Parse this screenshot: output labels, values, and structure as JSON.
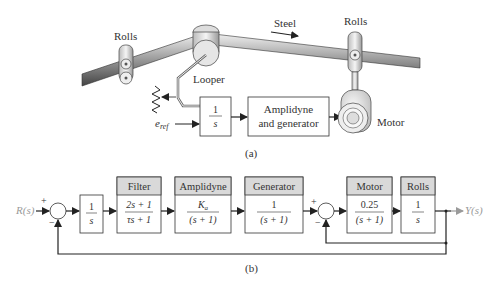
{
  "figure_a": {
    "caption": "(a)",
    "labels": {
      "rolls_left": "Rolls",
      "rolls_right": "Rolls",
      "steel": "Steel",
      "looper": "Looper",
      "motor": "Motor",
      "eref": "e",
      "eref_sub": "ref"
    },
    "blocks": [
      {
        "id": "integrator",
        "num": "1",
        "den": "s"
      },
      {
        "id": "amplidyne_generator",
        "line1": "Amplidyne",
        "line2": "and generator"
      }
    ]
  },
  "figure_b": {
    "caption": "(b)",
    "input_label": "R(s)",
    "output_label": "Y(s)",
    "sum1_signs": {
      "top": "+",
      "bottom": "−"
    },
    "sum2_signs": {
      "top": "+",
      "bottom": "−"
    },
    "blocks": [
      {
        "id": "integrator",
        "header": "",
        "num": "1",
        "den": "s"
      },
      {
        "id": "filter",
        "header": "Filter",
        "num": "2s + 1",
        "den": "τs + 1"
      },
      {
        "id": "amplidyne",
        "header": "Amplidyne",
        "num": "K",
        "num_sub": "a",
        "den": "(s + 1)"
      },
      {
        "id": "generator",
        "header": "Generator",
        "num": "1",
        "den": "(s + 1)"
      },
      {
        "id": "motor",
        "header": "Motor",
        "num": "0.25",
        "den": "(s + 1)"
      },
      {
        "id": "rolls",
        "header": "Rolls",
        "num": "1",
        "den": "s"
      }
    ]
  },
  "colors": {
    "line": "#222222",
    "header_fill": "#d9d9d9",
    "signal_label": "#9a9a9a"
  }
}
